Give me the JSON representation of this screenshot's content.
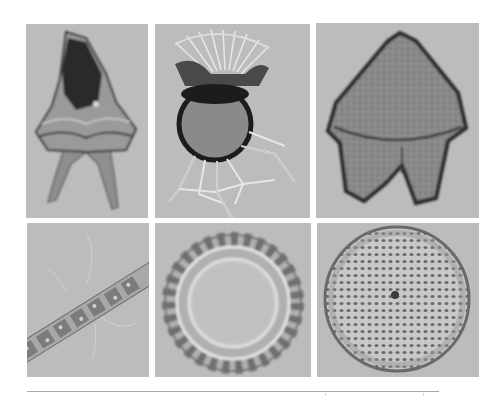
{
  "figure": {
    "layout": {
      "rows": 2,
      "columns": 3
    },
    "background_color": "#ffffff",
    "panel_background_color": "#bcbcbc",
    "panels": [
      {
        "position": "row-1-col-1",
        "subject": "dinoflagellate-horned-theca"
      },
      {
        "position": "row-1-col-2",
        "subject": "dinoflagellate-spherical-with-wing-lists"
      },
      {
        "position": "row-1-col-3",
        "subject": "dinoflagellate-pentagonal-theca"
      },
      {
        "position": "row-2-col-1",
        "subject": "chain-forming-diatom-filament"
      },
      {
        "position": "row-2-col-2",
        "subject": "centric-diatom-ring"
      },
      {
        "position": "row-2-col-3",
        "subject": "centric-diatom-disc-areolate"
      }
    ],
    "rule_color": "#a8a8a8"
  }
}
